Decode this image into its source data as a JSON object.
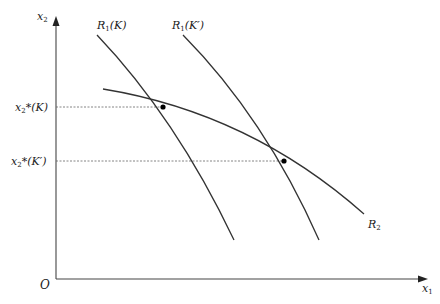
{
  "diagram": {
    "type": "reaction-function-diagram",
    "axes": {
      "x_label": "x",
      "x_label_sub": "1",
      "y_label": "x",
      "y_label_sub": "2",
      "origin_label": "O"
    },
    "curves": [
      {
        "id": "R1K",
        "label": "R",
        "label_sub": "1",
        "label_arg": "(K)"
      },
      {
        "id": "R1Kprime",
        "label": "R",
        "label_sub": "1",
        "label_arg": "(K′)"
      },
      {
        "id": "R2",
        "label": "R",
        "label_sub": "2",
        "label_arg": ""
      }
    ],
    "y_ticks": [
      {
        "label": "x",
        "sub": "2",
        "star": "*",
        "arg": "(K)"
      },
      {
        "label": "x",
        "sub": "2",
        "star": "*",
        "arg": "(K′)"
      }
    ],
    "equilibria": [
      {
        "name": "equilibrium-K",
        "description": "Intersection of R1(K) and R2"
      },
      {
        "name": "equilibrium-K-prime",
        "description": "Intersection of R1(K′) and R2"
      }
    ],
    "colors": {
      "line": "#333333",
      "axis": "#444444",
      "guide": "#666666",
      "background": "#ffffff"
    }
  }
}
